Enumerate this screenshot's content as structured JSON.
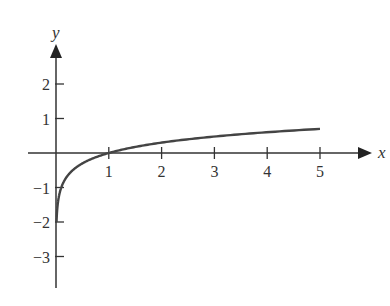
{
  "chart_data": {
    "type": "line",
    "title": "",
    "xlabel": "x",
    "ylabel": "y",
    "function": "y = log10(x)",
    "xlim": [
      0,
      5
    ],
    "ylim": [
      -3,
      2
    ],
    "x_ticks": [
      "1",
      "2",
      "3",
      "4",
      "5"
    ],
    "y_ticks": [
      "2",
      "1",
      "−1",
      "−2",
      "−3"
    ],
    "grid": false,
    "legend": null,
    "series": [
      {
        "name": "log10(x)",
        "x": [
          0.01,
          0.05,
          0.1,
          0.2,
          0.5,
          1,
          2,
          3,
          4,
          5
        ],
        "y": [
          -2,
          -1.3,
          -1,
          -0.7,
          -0.3,
          0,
          0.301,
          0.477,
          0.602,
          0.699
        ]
      }
    ],
    "color": "#444444"
  }
}
